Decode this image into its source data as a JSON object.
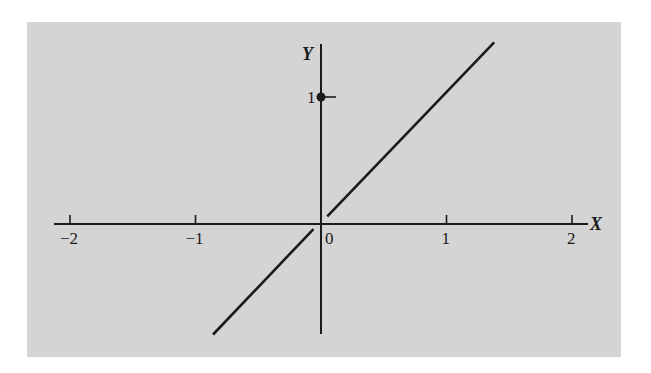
{
  "figure": {
    "x_axis_label": "X",
    "y_axis_label": "Y",
    "x_ticks": [
      {
        "value": -2,
        "label": "−2"
      },
      {
        "value": -1,
        "label": "−1"
      },
      {
        "value": 0,
        "label": "0"
      },
      {
        "value": 1,
        "label": "1"
      },
      {
        "value": 2,
        "label": "2"
      }
    ],
    "y_ticks": [
      {
        "value": 1,
        "label": "1"
      }
    ],
    "point": {
      "x": 0,
      "y": 1,
      "style": "filled"
    },
    "segments": [
      {
        "from": [
          -0.86,
          -0.87
        ],
        "to": [
          -0.06,
          -0.04
        ],
        "name": "lower-branch"
      },
      {
        "from": [
          0.05,
          0.06
        ],
        "to": [
          1.38,
          1.43
        ],
        "name": "upper-branch"
      }
    ],
    "colors": {
      "background": "#d4d4d4",
      "ink": "#1a1a1a"
    }
  }
}
